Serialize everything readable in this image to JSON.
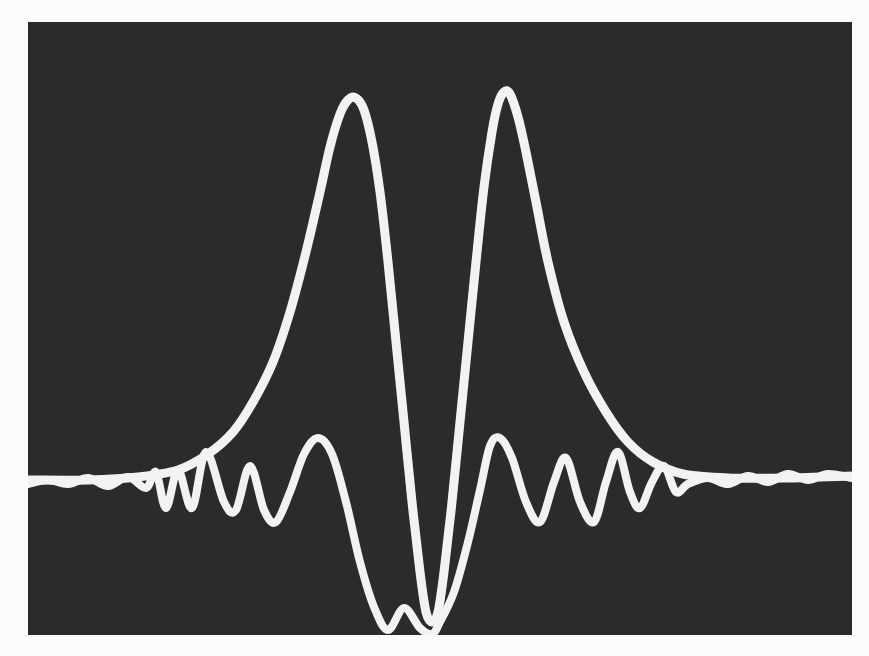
{
  "image": {
    "kind": "oscilloscope-photograph",
    "description": "Two superimposed waveforms on an oscilloscope screen: a twin-peaked envelope and a symmetric oscillating (ringing) waveform meeting in a deep central W-shaped dip.",
    "colors": {
      "page_background": "#fbfbfb",
      "screen_background": "#2b2b2b",
      "trace": "#f2f2f2"
    },
    "screen_rect": {
      "x": 28,
      "y": 22,
      "width": 824,
      "height": 613
    },
    "baseline_y": 458,
    "traces": [
      {
        "name": "twin-peak-envelope",
        "stroke_width": 9,
        "points": [
          [
            0,
            458
          ],
          [
            60,
            458
          ],
          [
            110,
            455
          ],
          [
            150,
            448
          ],
          [
            180,
            432
          ],
          [
            205,
            410
          ],
          [
            225,
            380
          ],
          [
            245,
            340
          ],
          [
            262,
            290
          ],
          [
            278,
            230
          ],
          [
            292,
            170
          ],
          [
            302,
            125
          ],
          [
            312,
            92
          ],
          [
            320,
            78
          ],
          [
            328,
            76
          ],
          [
            336,
            88
          ],
          [
            344,
            120
          ],
          [
            352,
            170
          ],
          [
            360,
            240
          ],
          [
            368,
            320
          ],
          [
            376,
            400
          ],
          [
            384,
            480
          ],
          [
            392,
            550
          ],
          [
            398,
            590
          ],
          [
            404,
            600
          ],
          [
            410,
            590
          ],
          [
            416,
            550
          ],
          [
            424,
            480
          ],
          [
            432,
            400
          ],
          [
            440,
            320
          ],
          [
            448,
            240
          ],
          [
            456,
            165
          ],
          [
            464,
            110
          ],
          [
            470,
            82
          ],
          [
            476,
            70
          ],
          [
            482,
            72
          ],
          [
            490,
            95
          ],
          [
            498,
            130
          ],
          [
            508,
            180
          ],
          [
            520,
            240
          ],
          [
            536,
            300
          ],
          [
            556,
            350
          ],
          [
            578,
            390
          ],
          [
            600,
            420
          ],
          [
            625,
            440
          ],
          [
            655,
            452
          ],
          [
            700,
            456
          ],
          [
            760,
            456
          ],
          [
            824,
            454
          ]
        ]
      },
      {
        "name": "ringing-waveform",
        "stroke_width": 8,
        "points": [
          [
            0,
            462
          ],
          [
            20,
            458
          ],
          [
            40,
            462
          ],
          [
            60,
            456
          ],
          [
            80,
            464
          ],
          [
            100,
            455
          ],
          [
            118,
            466
          ],
          [
            128,
            450
          ],
          [
            138,
            486
          ],
          [
            150,
            448
          ],
          [
            164,
            486
          ],
          [
            178,
            430
          ],
          [
            196,
            480
          ],
          [
            208,
            488
          ],
          [
            222,
            444
          ],
          [
            236,
            488
          ],
          [
            248,
            500
          ],
          [
            262,
            470
          ],
          [
            276,
            432
          ],
          [
            290,
            416
          ],
          [
            304,
            432
          ],
          [
            318,
            480
          ],
          [
            332,
            540
          ],
          [
            346,
            585
          ],
          [
            360,
            608
          ],
          [
            376,
            586
          ],
          [
            392,
            606
          ],
          [
            404,
            612
          ],
          [
            412,
            600
          ],
          [
            426,
            570
          ],
          [
            440,
            520
          ],
          [
            452,
            468
          ],
          [
            462,
            424
          ],
          [
            472,
            416
          ],
          [
            484,
            436
          ],
          [
            498,
            480
          ],
          [
            512,
            500
          ],
          [
            526,
            460
          ],
          [
            538,
            436
          ],
          [
            552,
            480
          ],
          [
            566,
            500
          ],
          [
            578,
            460
          ],
          [
            590,
            430
          ],
          [
            602,
            470
          ],
          [
            612,
            486
          ],
          [
            624,
            460
          ],
          [
            636,
            444
          ],
          [
            648,
            470
          ],
          [
            660,
            462
          ],
          [
            680,
            456
          ],
          [
            700,
            462
          ],
          [
            720,
            454
          ],
          [
            740,
            460
          ],
          [
            760,
            452
          ],
          [
            780,
            458
          ],
          [
            800,
            452
          ],
          [
            824,
            456
          ]
        ]
      }
    ]
  }
}
